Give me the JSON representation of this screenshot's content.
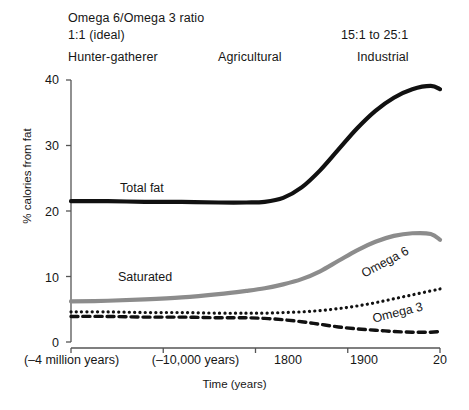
{
  "header": {
    "ratio_title": "Omega 6/Omega 3 ratio",
    "ratio_ideal": "1:1 (ideal)",
    "ratio_industrial": "15:1 to 25:1",
    "era_hunter": "Hunter-gatherer",
    "era_agricultural": "Agricultural",
    "era_industrial": "Industrial"
  },
  "chart_data": {
    "type": "line",
    "title": "Omega 6/Omega 3 ratio",
    "xlabel": "Time (years)",
    "ylabel": "% calories from fat",
    "ylim": [
      0,
      40
    ],
    "yticks": [
      0,
      10,
      20,
      30,
      40
    ],
    "ytick_labels": [
      "0",
      "10",
      "20",
      "30",
      "40"
    ],
    "xticks": [
      0,
      1,
      2,
      3,
      4
    ],
    "xtick_labels": [
      "(–4 million years)",
      "(–10,000 years)",
      "1800",
      "1900",
      "20"
    ],
    "grid": false,
    "legend": "inline-labels",
    "series": [
      {
        "name": "Total fat",
        "style": "solid",
        "color": "#111111",
        "width": 4.2,
        "label": "Total fat",
        "x": [
          0.0,
          0.4,
          0.8,
          1.2,
          1.6,
          1.9,
          2.1,
          2.3,
          2.5,
          2.7,
          2.9,
          3.1,
          3.3,
          3.5,
          3.7,
          3.9,
          4.0
        ],
        "y": [
          21.5,
          21.5,
          21.4,
          21.4,
          21.3,
          21.3,
          21.4,
          22.0,
          23.6,
          26.2,
          29.4,
          32.6,
          35.3,
          37.3,
          38.6,
          39.1,
          38.6
        ]
      },
      {
        "name": "Saturated",
        "style": "solid",
        "color": "#8c8c8c",
        "width": 4.2,
        "label": "Saturated",
        "x": [
          0.0,
          0.4,
          0.8,
          1.2,
          1.6,
          1.9,
          2.1,
          2.3,
          2.5,
          2.7,
          2.9,
          3.1,
          3.3,
          3.5,
          3.7,
          3.9,
          4.0
        ],
        "y": [
          6.2,
          6.3,
          6.5,
          6.8,
          7.3,
          7.8,
          8.2,
          8.8,
          9.6,
          10.8,
          12.4,
          14.0,
          15.3,
          16.2,
          16.6,
          16.5,
          15.6
        ]
      },
      {
        "name": "Omega 6",
        "style": "dotted",
        "color": "#111111",
        "width": 3.2,
        "label": "Omega 6",
        "x": [
          0.0,
          0.4,
          0.8,
          1.2,
          1.6,
          1.9,
          2.1,
          2.3,
          2.5,
          2.7,
          2.9,
          3.1,
          3.3,
          3.5,
          3.7,
          3.9,
          4.0
        ],
        "y": [
          4.6,
          4.6,
          4.5,
          4.5,
          4.4,
          4.4,
          4.4,
          4.5,
          4.6,
          4.8,
          5.1,
          5.5,
          6.0,
          6.6,
          7.2,
          7.8,
          8.1
        ]
      },
      {
        "name": "Omega 3",
        "style": "dashed",
        "color": "#111111",
        "width": 3.4,
        "label": "Omega 3",
        "x": [
          0.0,
          0.4,
          0.8,
          1.2,
          1.6,
          1.9,
          2.1,
          2.3,
          2.5,
          2.7,
          2.9,
          3.1,
          3.3,
          3.5,
          3.7,
          3.9,
          4.0
        ],
        "y": [
          3.9,
          3.9,
          3.8,
          3.8,
          3.7,
          3.7,
          3.6,
          3.4,
          3.1,
          2.7,
          2.3,
          2.0,
          1.8,
          1.6,
          1.5,
          1.5,
          1.6
        ]
      }
    ]
  },
  "axes": {
    "y_label": "% calories from fat",
    "x_label": "Time (years)",
    "y_ticks": [
      "40",
      "30",
      "20",
      "10",
      "0"
    ],
    "x_ticks": [
      "(–4 million years)",
      "(–10,000 years)",
      "1800",
      "1900",
      "20"
    ]
  }
}
